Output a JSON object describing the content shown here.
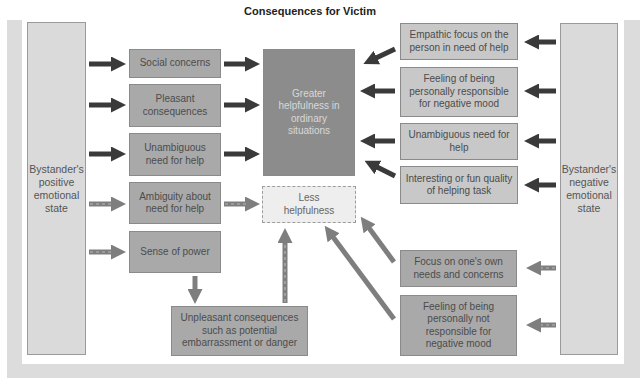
{
  "title": "Consequences for Victim",
  "left_panel": {
    "label": "Bystander's positive emotional state"
  },
  "right_panel": {
    "label": "Bystander's negative emotional state"
  },
  "positive_mediators": [
    {
      "label": "Social concerns",
      "path": "solid"
    },
    {
      "label": "Pleasant consequences",
      "path": "solid"
    },
    {
      "label": "Unambiguous need for help",
      "path": "solid"
    },
    {
      "label": "Ambiguity about need for help",
      "path": "dashed"
    },
    {
      "label": "Sense of power",
      "path": "dashed"
    }
  ],
  "negative_mediators": [
    {
      "label": "Empathic focus on the person in need of help",
      "path": "solid"
    },
    {
      "label": "Feeling of being personally responsible for negative mood",
      "path": "solid"
    },
    {
      "label": "Unambiguous need for help",
      "path": "solid"
    },
    {
      "label": "Interesting or fun quality of helping task",
      "path": "solid"
    },
    {
      "label": "Focus on one's own needs and concerns",
      "path": "dashed"
    },
    {
      "label": "Feeling of being personally not responsible for negative mood",
      "path": "dashed"
    }
  ],
  "outcomes": {
    "greater": "Greater helpfulness in ordinary situations",
    "less": "Less helpfulness"
  },
  "unpleasant": {
    "label": "Unpleasant consequences such as potential embarrassment or danger"
  },
  "colors": {
    "solid_arrow": "#3a3a3a",
    "dashed_arrow": "#7e7e7e",
    "greater_box": "#8c8c8c",
    "mediator_box": "#a9a9a9",
    "right_box": "#c8c8c8",
    "panel": "#dadada"
  }
}
